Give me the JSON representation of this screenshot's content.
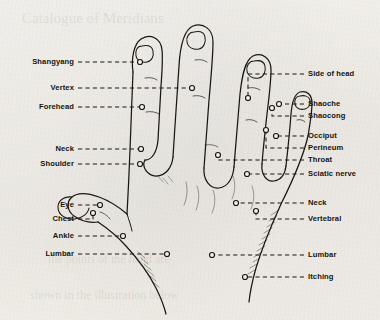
{
  "figure": {
    "ink_color": "#1a1713",
    "paper_color": "#f4f2ee",
    "width": 380,
    "height": 320
  },
  "labels_left": [
    {
      "id": "shangyang",
      "text": "Shangyang",
      "y": 62,
      "text_right_x": 74,
      "leader_end_x": 140,
      "dot_x": 140,
      "dot_y": 62
    },
    {
      "id": "vertex",
      "text": "Vertex",
      "y": 88,
      "text_right_x": 74,
      "leader_end_x": 192,
      "dot_x": 192,
      "dot_y": 88
    },
    {
      "id": "forehead",
      "text": "Forehead",
      "y": 107,
      "text_right_x": 74,
      "leader_end_x": 142,
      "dot_x": 142,
      "dot_y": 107
    },
    {
      "id": "neck-left",
      "text": "Neck",
      "y": 149,
      "text_right_x": 74,
      "leader_end_x": 141,
      "dot_x": 141,
      "dot_y": 149
    },
    {
      "id": "shoulder",
      "text": "Shoulder",
      "y": 164,
      "text_right_x": 74,
      "leader_end_x": 140,
      "dot_x": 140,
      "dot_y": 164
    },
    {
      "id": "eye",
      "text": "Eye",
      "y": 205,
      "text_right_x": 74,
      "leader_end_x": 100,
      "dot_x": 100,
      "dot_y": 205
    },
    {
      "id": "chest",
      "text": "Chest",
      "y": 219,
      "text_right_x": 74,
      "leader_end_x": 93,
      "dot_x": 93,
      "dot_y": 213
    },
    {
      "id": "ankle",
      "text": "Ankle",
      "y": 236,
      "text_right_x": 74,
      "leader_end_x": 123,
      "dot_x": 123,
      "dot_y": 236
    },
    {
      "id": "lumbar-left",
      "text": "Lumbar",
      "y": 254,
      "text_right_x": 74,
      "leader_end_x": 167,
      "dot_x": 167,
      "dot_y": 254
    }
  ],
  "labels_right": [
    {
      "id": "side-of-head",
      "text": "Side of head",
      "y": 74,
      "text_left_x": 308,
      "leader_start_x": 248,
      "dot_x": 248,
      "dot_y": 98,
      "riser": true
    },
    {
      "id": "shaoche",
      "text": "Shaoche",
      "y": 104,
      "text_left_x": 308,
      "leader_start_x": 279,
      "dot_x": 279,
      "dot_y": 104,
      "riser": false
    },
    {
      "id": "shaocong",
      "text": "Shaocong",
      "y": 116,
      "text_left_x": 308,
      "leader_start_x": 272,
      "dot_x": 272,
      "dot_y": 108,
      "riser": true
    },
    {
      "id": "occiput",
      "text": "Occiput",
      "y": 136,
      "text_left_x": 308,
      "leader_start_x": 276,
      "dot_x": 276,
      "dot_y": 136,
      "riser": false
    },
    {
      "id": "perineum",
      "text": "Perineum",
      "y": 148,
      "text_left_x": 308,
      "leader_start_x": 266,
      "dot_x": 266,
      "dot_y": 130,
      "riser": true
    },
    {
      "id": "throat",
      "text": "Throat",
      "y": 160,
      "text_left_x": 308,
      "leader_start_x": 218,
      "dot_x": 218,
      "dot_y": 155,
      "riser": true
    },
    {
      "id": "sciatic-nerve",
      "text": "Sciatic nerve",
      "y": 174,
      "text_left_x": 308,
      "leader_start_x": 247,
      "dot_x": 247,
      "dot_y": 174,
      "riser": false
    },
    {
      "id": "neck-right",
      "text": "Neck",
      "y": 203,
      "text_left_x": 308,
      "leader_start_x": 236,
      "dot_x": 236,
      "dot_y": 203,
      "riser": false
    },
    {
      "id": "vertebral",
      "text": "Vertebral",
      "y": 219,
      "text_left_x": 308,
      "leader_start_x": 256,
      "dot_x": 256,
      "dot_y": 211,
      "riser": true
    },
    {
      "id": "lumbar-right",
      "text": "Lumbar",
      "y": 255,
      "text_left_x": 308,
      "leader_start_x": 212,
      "dot_x": 212,
      "dot_y": 255,
      "riser": false
    },
    {
      "id": "itching",
      "text": "Itching",
      "y": 277,
      "text_left_x": 308,
      "leader_start_x": 245,
      "dot_x": 245,
      "dot_y": 277,
      "riser": false
    }
  ],
  "ghost_text": [
    {
      "id": "ghost-top",
      "text": "Catalogue of Meridians",
      "x": 22,
      "y": 10,
      "size": 15
    },
    {
      "id": "ghost-mid",
      "text": "the points of the hand are",
      "x": 48,
      "y": 252,
      "size": 12
    },
    {
      "id": "ghost-bottom",
      "text": "shown in the illustration below",
      "x": 30,
      "y": 288,
      "size": 12
    }
  ]
}
